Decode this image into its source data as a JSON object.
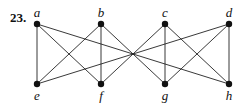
{
  "problem": {
    "number": "23."
  },
  "graph": {
    "nodes": [
      {
        "id": "a",
        "label": "a",
        "x": 37,
        "y": 24,
        "label_pos": "above"
      },
      {
        "id": "b",
        "label": "b",
        "x": 101,
        "y": 24,
        "label_pos": "above"
      },
      {
        "id": "c",
        "label": "c",
        "x": 165,
        "y": 24,
        "label_pos": "above"
      },
      {
        "id": "d",
        "label": "d",
        "x": 229,
        "y": 24,
        "label_pos": "above"
      },
      {
        "id": "e",
        "label": "e",
        "x": 37,
        "y": 84,
        "label_pos": "below"
      },
      {
        "id": "f",
        "label": "f",
        "x": 101,
        "y": 84,
        "label_pos": "below"
      },
      {
        "id": "g",
        "label": "g",
        "x": 165,
        "y": 84,
        "label_pos": "below"
      },
      {
        "id": "h",
        "label": "h",
        "x": 229,
        "y": 84,
        "label_pos": "below"
      }
    ],
    "edges": [
      [
        "a",
        "e"
      ],
      [
        "a",
        "f"
      ],
      [
        "a",
        "h"
      ],
      [
        "b",
        "e"
      ],
      [
        "b",
        "f"
      ],
      [
        "b",
        "g"
      ],
      [
        "c",
        "f"
      ],
      [
        "c",
        "g"
      ],
      [
        "c",
        "h"
      ],
      [
        "d",
        "e"
      ],
      [
        "d",
        "g"
      ],
      [
        "d",
        "h"
      ]
    ],
    "colors": {
      "edge": "#222222",
      "node": "#111111",
      "background": "#ffffff"
    }
  }
}
